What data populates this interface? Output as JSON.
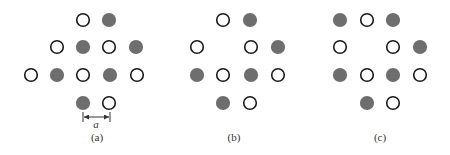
{
  "figure": {
    "colors": {
      "open_stroke": "#1a1a1a",
      "open_fill": "#ffffff",
      "filled_fill": "#6e6e6e",
      "text": "#333333"
    },
    "circle_radius": 6.3,
    "panels": [
      {
        "id": "a",
        "label": "(a)",
        "label_pos": [
          97,
          141
        ],
        "circles": [
          {
            "x": 83,
            "y": 20,
            "type": "open"
          },
          {
            "x": 109,
            "y": 20,
            "type": "filled"
          },
          {
            "x": 57,
            "y": 47,
            "type": "open"
          },
          {
            "x": 83,
            "y": 47,
            "type": "filled"
          },
          {
            "x": 109,
            "y": 47,
            "type": "open"
          },
          {
            "x": 136,
            "y": 47,
            "type": "filled"
          },
          {
            "x": 31,
            "y": 75,
            "type": "open"
          },
          {
            "x": 57,
            "y": 75,
            "type": "filled"
          },
          {
            "x": 83,
            "y": 75,
            "type": "open"
          },
          {
            "x": 110,
            "y": 75,
            "type": "filled"
          },
          {
            "x": 137,
            "y": 75,
            "type": "open"
          },
          {
            "x": 83,
            "y": 103,
            "type": "filled"
          },
          {
            "x": 109,
            "y": 103,
            "type": "open"
          }
        ],
        "dimension": {
          "label": "a",
          "x1": 83,
          "x2": 110,
          "y": 117,
          "label_pos": [
            96,
            128
          ]
        }
      },
      {
        "id": "b",
        "label": "(b)",
        "label_pos": [
          234,
          141
        ],
        "circles": [
          {
            "x": 223,
            "y": 20,
            "type": "open"
          },
          {
            "x": 250,
            "y": 20,
            "type": "filled"
          },
          {
            "x": 197,
            "y": 47,
            "type": "open"
          },
          {
            "x": 251,
            "y": 47,
            "type": "open"
          },
          {
            "x": 278,
            "y": 47,
            "type": "filled"
          },
          {
            "x": 197,
            "y": 75,
            "type": "filled"
          },
          {
            "x": 223,
            "y": 75,
            "type": "open"
          },
          {
            "x": 251,
            "y": 75,
            "type": "filled"
          },
          {
            "x": 278,
            "y": 75,
            "type": "open"
          },
          {
            "x": 223,
            "y": 103,
            "type": "filled"
          },
          {
            "x": 250,
            "y": 103,
            "type": "open"
          }
        ]
      },
      {
        "id": "c",
        "label": "(c)",
        "label_pos": [
          380,
          141
        ],
        "circles": [
          {
            "x": 340,
            "y": 20,
            "type": "filled"
          },
          {
            "x": 367,
            "y": 20,
            "type": "open"
          },
          {
            "x": 393,
            "y": 20,
            "type": "filled"
          },
          {
            "x": 340,
            "y": 47,
            "type": "open"
          },
          {
            "x": 393,
            "y": 47,
            "type": "open"
          },
          {
            "x": 420,
            "y": 47,
            "type": "filled"
          },
          {
            "x": 340,
            "y": 75,
            "type": "filled"
          },
          {
            "x": 367,
            "y": 75,
            "type": "open"
          },
          {
            "x": 393,
            "y": 75,
            "type": "filled"
          },
          {
            "x": 420,
            "y": 75,
            "type": "open"
          },
          {
            "x": 367,
            "y": 103,
            "type": "filled"
          },
          {
            "x": 393,
            "y": 103,
            "type": "open"
          }
        ]
      }
    ]
  }
}
